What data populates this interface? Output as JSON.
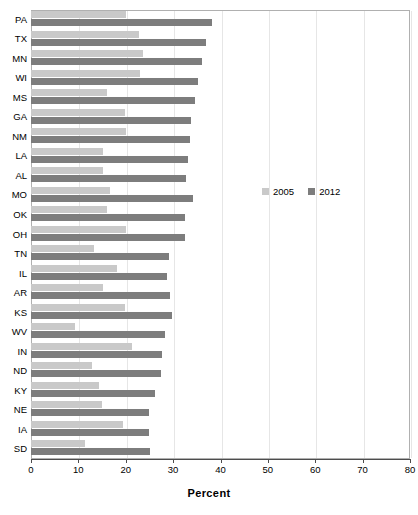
{
  "chart_data": {
    "type": "bar",
    "orientation": "horizontal",
    "title": "",
    "xlabel": "Percent",
    "ylabel": "",
    "xlim": [
      0,
      80
    ],
    "xticks": [
      0,
      10,
      20,
      30,
      40,
      50,
      60,
      70,
      80
    ],
    "grid": true,
    "legend_position": "center-right",
    "categories": [
      "PA",
      "TX",
      "MN",
      "WI",
      "MS",
      "GA",
      "NM",
      "LA",
      "AL",
      "MO",
      "OK",
      "OH",
      "TN",
      "IL",
      "AR",
      "KS",
      "WV",
      "IN",
      "ND",
      "KY",
      "NE",
      "IA",
      "SD"
    ],
    "series": [
      {
        "name": "2005",
        "color": "#c9c9c9",
        "values": [
          20.1,
          22.8,
          23.6,
          23.0,
          16.0,
          19.9,
          20.1,
          15.1,
          15.3,
          16.6,
          16.0,
          20.1,
          13.2,
          18.1,
          15.2,
          19.9,
          9.3,
          21.4,
          12.8,
          14.3,
          14.9,
          19.4,
          11.3
        ]
      },
      {
        "name": "2012",
        "color": "#7d7d7d",
        "values": [
          38.3,
          37.0,
          36.1,
          35.3,
          34.6,
          33.7,
          33.6,
          33.2,
          32.8,
          34.1,
          32.6,
          32.6,
          29.2,
          28.7,
          29.4,
          29.8,
          28.3,
          27.7,
          27.4,
          26.1,
          24.9,
          24.9,
          25.1
        ]
      }
    ]
  },
  "legend": {
    "items": [
      {
        "label": "2005"
      },
      {
        "label": "2012"
      }
    ]
  },
  "axis": {
    "x_title": "Percent",
    "tick_labels": [
      "0",
      "10",
      "20",
      "30",
      "40",
      "50",
      "60",
      "70",
      "80"
    ]
  }
}
